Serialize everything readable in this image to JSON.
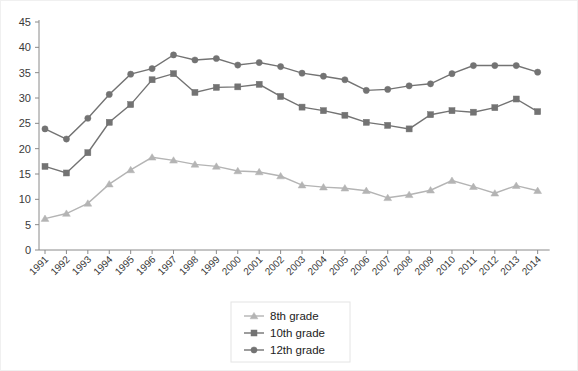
{
  "chart_data": {
    "type": "line",
    "title": "",
    "subtitle": "",
    "xlabel": "",
    "ylabel": "",
    "x": [
      "1991",
      "1992",
      "1993",
      "1994",
      "1995",
      "1996",
      "1997",
      "1998",
      "1999",
      "2000",
      "2001",
      "2002",
      "2003",
      "2004",
      "2005",
      "2006",
      "2007",
      "2008",
      "2009",
      "2010",
      "2011",
      "2012",
      "2013",
      "2014"
    ],
    "ylim": [
      0,
      45
    ],
    "yticks": [
      0,
      5,
      10,
      15,
      20,
      25,
      30,
      35,
      40,
      45
    ],
    "grid": false,
    "legend_position": "bottom-center",
    "series": [
      {
        "name": "8th grade",
        "marker": "triangle",
        "color": "#b4b4b4",
        "values": [
          6.2,
          7.2,
          9.2,
          13.0,
          15.8,
          18.3,
          17.7,
          16.9,
          16.5,
          15.6,
          15.4,
          14.6,
          12.8,
          12.4,
          12.2,
          11.7,
          10.3,
          10.9,
          11.8,
          13.7,
          12.5,
          11.2,
          12.7,
          11.7
        ]
      },
      {
        "name": "10th grade",
        "marker": "square",
        "color": "#737373",
        "values": [
          16.5,
          15.2,
          19.2,
          25.2,
          28.7,
          33.6,
          34.8,
          31.1,
          32.1,
          32.2,
          32.7,
          30.3,
          28.2,
          27.5,
          26.6,
          25.2,
          24.6,
          23.9,
          26.7,
          27.5,
          27.2,
          28.1,
          29.8,
          27.3
        ]
      },
      {
        "name": "12th grade",
        "marker": "circle",
        "color": "#737373",
        "values": [
          23.9,
          21.9,
          26.0,
          30.7,
          34.7,
          35.8,
          38.5,
          37.5,
          37.8,
          36.5,
          37.0,
          36.2,
          34.9,
          34.3,
          33.6,
          31.5,
          31.7,
          32.4,
          32.8,
          34.8,
          36.4,
          36.4,
          36.4,
          35.1
        ]
      }
    ]
  },
  "legend": {
    "items": [
      {
        "label": "8th grade"
      },
      {
        "label": "10th grade"
      },
      {
        "label": "12th grade"
      }
    ]
  }
}
